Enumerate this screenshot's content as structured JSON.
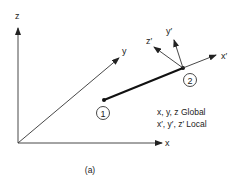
{
  "diagram": {
    "global_axes": {
      "x": "x",
      "y": "y",
      "z": "z"
    },
    "local_axes": {
      "x": "x′",
      "y": "y′",
      "z": "z′"
    },
    "nodes": [
      {
        "label": "1"
      },
      {
        "label": "2"
      }
    ],
    "legend": {
      "global": "x, y, z Global",
      "local": "x′, y′, z′ Local"
    },
    "caption": "(a)"
  }
}
